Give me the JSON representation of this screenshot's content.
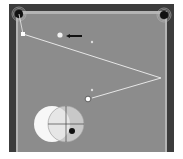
{
  "diagram": {
    "type": "billiards-shot-diagram",
    "table": {
      "rail_color": "#3c3c3c",
      "cushion_color": "#b4b4b4",
      "felt_color": "#8c8c8c",
      "background": "#ffffff"
    },
    "pockets": [
      {
        "name": "top-left-pocket",
        "x": 19,
        "y": 14
      },
      {
        "name": "top-right-pocket",
        "x": 164,
        "y": 15
      }
    ],
    "balls": {
      "cue_ball": {
        "x": 88,
        "y": 99
      },
      "object_ball": {
        "x": 60,
        "y": 35
      },
      "start_marker": {
        "x": 23,
        "y": 34
      }
    },
    "markers": [
      {
        "name": "ghost-spot-1",
        "x": 92,
        "y": 42
      },
      {
        "name": "ghost-spot-2",
        "x": 92,
        "y": 91
      }
    ],
    "arrow": {
      "from_x": 80,
      "from_y": 36,
      "to_x": 66,
      "to_y": 36,
      "label": "direction-arrow"
    },
    "path": [
      {
        "x": 23,
        "y": 34
      },
      {
        "x": 161,
        "y": 78
      },
      {
        "x": 93,
        "y": 97
      }
    ],
    "aim_chart": {
      "cue_circle": {
        "cx": 52,
        "cy": 124,
        "r": 18
      },
      "object_circle": {
        "cx": 66,
        "cy": 124,
        "r": 18
      },
      "contact_dot": {
        "cx": 72,
        "cy": 130,
        "r": 3
      }
    }
  }
}
